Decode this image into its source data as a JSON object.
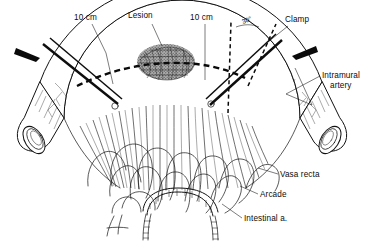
{
  "figure": {
    "background_color": "#ffffff",
    "ink_color": "#111111",
    "style": "line drawing"
  },
  "labels": {
    "margin_left": "10 cm",
    "lesion": "Lesion",
    "margin_right": "10 cm",
    "angle": "30°",
    "clamp": "Clamp",
    "intramural_artery_line1": "Intramural",
    "intramural_artery_line2": "artery",
    "vasa_recta": "Vasa recta",
    "arcade": "Arcade",
    "intestinal_artery": "Intestinal a."
  },
  "annotations": {
    "resection_line_style": "dashed",
    "clamp_angle_degrees": 30,
    "proximal_margin_cm": 10,
    "distal_margin_cm": 10,
    "arrow_count": 2,
    "clamp_count": 2,
    "clamp_tip_marker": "open-circle"
  },
  "structures": [
    {
      "name": "bowel-wall",
      "description": "curved band of small intestine along outer arc"
    },
    {
      "name": "lesion-mass",
      "description": "dark stippled oval tumour on antimesenteric bowel wall"
    },
    {
      "name": "mesentery-fan",
      "description": "fan shaped mesentery between bowel and root"
    },
    {
      "name": "vasa-recta",
      "description": "long straight vessels from arcades to bowel wall"
    },
    {
      "name": "arcade",
      "description": "nested arterial arcade loops near mesenteric root"
    },
    {
      "name": "intestinal-artery",
      "description": "intestinal artery at mesenteric root"
    },
    {
      "name": "intramural-artery",
      "description": "branching arteries within the bowel wall"
    },
    {
      "name": "cut-end-left",
      "description": "transected proximal bowel end showing lumen"
    },
    {
      "name": "cut-end-right",
      "description": "transected distal bowel end showing lumen"
    }
  ]
}
